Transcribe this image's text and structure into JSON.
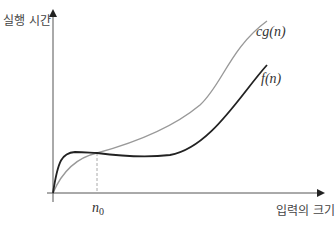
{
  "diagram": {
    "y_axis_label": "실행 시간",
    "x_axis_label": "입력의 크기",
    "curves": [
      {
        "id": "cg",
        "label_main": "cg",
        "label_arg": "(n)",
        "color": "#999999"
      },
      {
        "id": "f",
        "label_main": "f",
        "label_arg": "(n)",
        "color": "#222222"
      }
    ],
    "threshold": {
      "label_main": "n",
      "label_sub": "0"
    },
    "colors": {
      "axis": "#555555",
      "dashed": "#aaaaaa"
    }
  }
}
